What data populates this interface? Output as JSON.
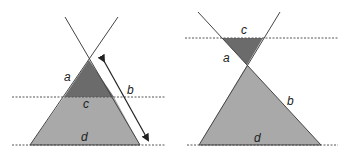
{
  "colors": {
    "dark_fill": "#6b6b6b",
    "light_fill": "#a9a9a9",
    "stroke": "#444444"
  },
  "left_diagram": {
    "labels": {
      "a": "a",
      "b": "b",
      "c": "c",
      "d": "d"
    }
  },
  "right_diagram": {
    "labels": {
      "a": "a",
      "b": "b",
      "c": "c",
      "d": "d"
    }
  }
}
